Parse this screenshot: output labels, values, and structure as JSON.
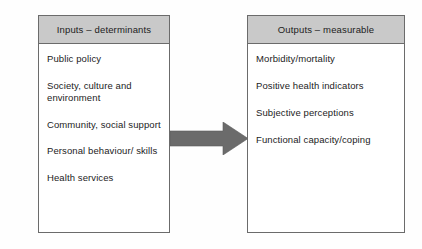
{
  "diagram": {
    "background_color": "#fefefe",
    "header_fill": "#c9c9c9",
    "border_color": "#6b6b6b",
    "text_color": "#1c1c1c",
    "arrow_color": "#6b6b6b"
  },
  "inputs": {
    "header": "Inputs – determinants",
    "items": [
      "Public policy",
      "Society, culture and environment",
      "Community, social support",
      "Personal behaviour/ skills",
      "Health services"
    ]
  },
  "outputs": {
    "header": "Outputs – measurable",
    "items": [
      "Morbidity/mortality",
      "Positive health indicators",
      "Subjective perceptions",
      "Functional capacity/coping"
    ]
  },
  "arrow": {
    "name": "right-arrow",
    "direction": "right",
    "from": "Inputs – determinants",
    "to": "Outputs – measurable"
  }
}
